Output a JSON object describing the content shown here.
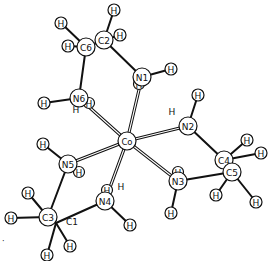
{
  "figure": {
    "type": "molecular-structure"
  },
  "atoms": [
    {
      "id": "Co",
      "label": "Co",
      "x": 127,
      "y": 141,
      "r": 9
    },
    {
      "id": "N1",
      "label": "N1",
      "x": 142,
      "y": 77,
      "r": 9
    },
    {
      "id": "N2",
      "label": "N2",
      "x": 188,
      "y": 126,
      "r": 9
    },
    {
      "id": "N3",
      "label": "N3",
      "x": 178,
      "y": 181,
      "r": 9
    },
    {
      "id": "N4",
      "label": "N4",
      "x": 105,
      "y": 201,
      "r": 9
    },
    {
      "id": "N5",
      "label": "N5",
      "x": 68,
      "y": 164,
      "r": 9
    },
    {
      "id": "N6",
      "label": "N6",
      "x": 79,
      "y": 98,
      "r": 9
    },
    {
      "id": "C1",
      "label": "C1",
      "x": 56,
      "y": 223,
      "r": 9
    },
    {
      "id": "C2",
      "label": "C2",
      "x": 104,
      "y": 40,
      "r": 9
    },
    {
      "id": "C3",
      "label": "C3",
      "x": 48,
      "y": 217,
      "r": 9
    },
    {
      "id": "C4",
      "label": "C4",
      "x": 224,
      "y": 160,
      "r": 9
    },
    {
      "id": "C5",
      "label": "C5",
      "x": 232,
      "y": 172,
      "r": 9
    },
    {
      "id": "C6",
      "label": "C6",
      "x": 86,
      "y": 47,
      "r": 9
    }
  ],
  "hydrogens": [
    {
      "label": "H",
      "x": 114,
      "y": 10,
      "bond_to": "C2"
    },
    {
      "label": "H",
      "x": 120,
      "y": 35,
      "bond_to": "C2"
    },
    {
      "label": "H",
      "x": 61,
      "y": 23,
      "bond_to": "C6"
    },
    {
      "label": "H",
      "x": 68,
      "y": 46,
      "bond_to": "C6"
    },
    {
      "label": "H",
      "x": 171,
      "y": 69,
      "bond_to": "N1"
    },
    {
      "label": "H",
      "x": 44,
      "y": 103,
      "bond_to": "N6"
    },
    {
      "label": "H",
      "x": 198,
      "y": 95,
      "bond_to": "N2"
    },
    {
      "label": "H",
      "x": 247,
      "y": 140,
      "bond_to": "C4"
    },
    {
      "label": "H",
      "x": 261,
      "y": 153,
      "bond_to": "C4"
    },
    {
      "label": "H",
      "x": 216,
      "y": 195,
      "bond_to": "C5"
    },
    {
      "label": "H",
      "x": 256,
      "y": 202,
      "bond_to": "C5"
    },
    {
      "label": "H",
      "x": 171,
      "y": 213,
      "bond_to": "N3"
    },
    {
      "label": "H",
      "x": 43,
      "y": 144,
      "bond_to": "N5"
    },
    {
      "label": "H",
      "x": 28,
      "y": 193,
      "bond_to": "C3"
    },
    {
      "label": "H",
      "x": 11,
      "y": 218,
      "bond_to": "C3"
    },
    {
      "label": "H",
      "x": 70,
      "y": 246,
      "bond_to": "C1"
    },
    {
      "label": "H",
      "x": 47,
      "y": 255,
      "bond_to": "C1"
    },
    {
      "label": "H",
      "x": 130,
      "y": 225,
      "bond_to": "N4"
    }
  ],
  "hidden_hydrogens": [
    {
      "label": "H",
      "x": 139,
      "y": 84,
      "on": "N1",
      "circled": true
    },
    {
      "label": "H",
      "x": 89,
      "y": 103,
      "on": "N6",
      "circled": true
    },
    {
      "label": "H",
      "x": 79,
      "y": 172,
      "on": "N5",
      "circled": true
    },
    {
      "label": "H",
      "x": 178,
      "y": 172,
      "on": "N3",
      "circled": true
    },
    {
      "label": "H",
      "x": 107,
      "y": 190,
      "on": "N4",
      "circled": true
    }
  ],
  "floating_labels": [
    {
      "text": "H",
      "x": 76,
      "y": 113
    },
    {
      "text": "H",
      "x": 172,
      "y": 115
    },
    {
      "text": "H",
      "x": 121,
      "y": 190
    },
    {
      "text": "C1",
      "x": 72,
      "y": 225
    }
  ],
  "coordinate_bonds": [
    [
      "Co",
      "N1"
    ],
    [
      "Co",
      "N2"
    ],
    [
      "Co",
      "N3"
    ],
    [
      "Co",
      "N4"
    ],
    [
      "Co",
      "N5"
    ],
    [
      "Co",
      "N6"
    ]
  ],
  "covalent_bonds": [
    [
      "C2",
      "N1"
    ],
    [
      "C6",
      "N6"
    ],
    [
      "C6",
      "C2"
    ],
    [
      "N2",
      "C4"
    ],
    [
      "N3",
      "C5"
    ],
    [
      "N5",
      "C3"
    ],
    [
      "N4",
      "C1"
    ]
  ],
  "stray_marks": [
    {
      "text": "·",
      "x": 2,
      "y": 244
    }
  ]
}
